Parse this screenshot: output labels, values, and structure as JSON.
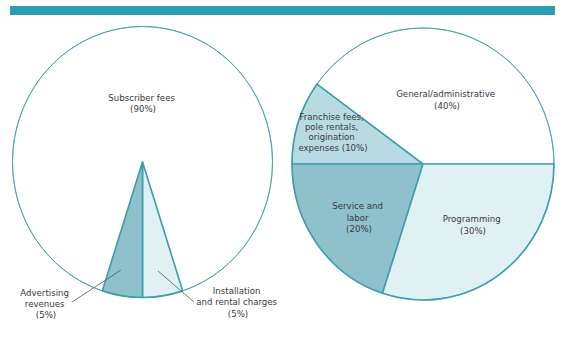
{
  "header": {
    "accent_color": "#2a9eb0"
  },
  "colors": {
    "outline": "#3f9eac",
    "leader": "#555555",
    "text": "#3a3a3a"
  },
  "chart_data": [
    {
      "type": "pie",
      "title": "",
      "slices": [
        {
          "label_lines": [
            "Subscriber fees",
            "(90%)"
          ],
          "name": "Subscriber fees",
          "value": 90,
          "color": "#ffffff"
        },
        {
          "label_lines": [
            "Installation",
            "and rental charges",
            "(5%)"
          ],
          "name": "Installation and rental charges",
          "value": 5,
          "color": "#e0f1f4"
        },
        {
          "label_lines": [
            "Advertising",
            "revenues",
            "(5%)"
          ],
          "name": "Advertising revenues",
          "value": 5,
          "color": "#8fc1cd"
        }
      ]
    },
    {
      "type": "pie",
      "title": "",
      "slices": [
        {
          "label_lines": [
            "General/administrative",
            "(40%)"
          ],
          "name": "General/administrative",
          "value": 40,
          "color": "#ffffff"
        },
        {
          "label_lines": [
            "Franchise fees,",
            "pole rentals,",
            "origination",
            "expenses (10%)"
          ],
          "name": "Franchise fees, pole rentals, origination expenses",
          "value": 10,
          "color": "#b8dae2"
        },
        {
          "label_lines": [
            "Service and",
            "labor",
            "(20%)"
          ],
          "name": "Service and labor",
          "value": 20,
          "color": "#8fc1cd"
        },
        {
          "label_lines": [
            "Programming",
            "(30%)"
          ],
          "name": "Programming",
          "value": 30,
          "color": "#e0f1f4"
        }
      ]
    }
  ]
}
